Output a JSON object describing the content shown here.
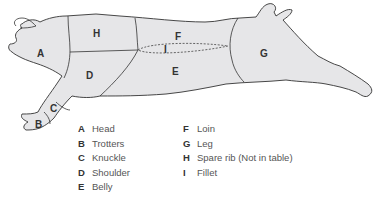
{
  "diagram": {
    "colors": {
      "fill": "#e6e6e8",
      "outline": "#333333",
      "background": "#ffffff"
    },
    "regions": [
      {
        "key": "A",
        "name": "Head"
      },
      {
        "key": "B",
        "name": "Trotters"
      },
      {
        "key": "C",
        "name": "Knuckle"
      },
      {
        "key": "D",
        "name": "Shoulder"
      },
      {
        "key": "E",
        "name": "Belly"
      },
      {
        "key": "F",
        "name": "Loin"
      },
      {
        "key": "G",
        "name": "Leg"
      },
      {
        "key": "H",
        "name": "Spare rib"
      },
      {
        "key": "I",
        "name": "Fillet"
      }
    ]
  },
  "legend": {
    "left": [
      {
        "key": "A",
        "label": "Head"
      },
      {
        "key": "B",
        "label": "Trotters"
      },
      {
        "key": "C",
        "label": "Knuckle"
      },
      {
        "key": "D",
        "label": "Shoulder"
      },
      {
        "key": "E",
        "label": "Belly"
      }
    ],
    "right": [
      {
        "key": "F",
        "label": "Loin"
      },
      {
        "key": "G",
        "label": "Leg"
      },
      {
        "key": "H",
        "label": "Spare rib (Not in table)"
      },
      {
        "key": "I",
        "label": "Fillet"
      }
    ]
  }
}
